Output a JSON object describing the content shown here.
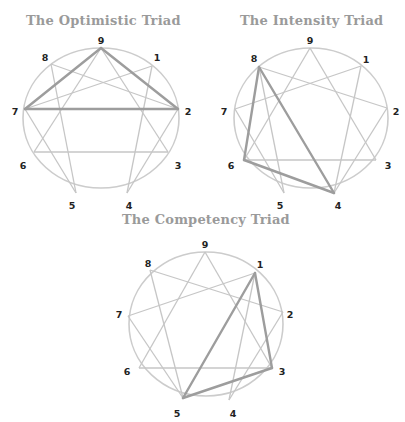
{
  "colors": {
    "title": "#9a9a9a",
    "circle": "#cccccc",
    "line": "#c6c6c6",
    "highlight": "#9d9d9d",
    "number": "#222222"
  },
  "diagrams": [
    {
      "title": "The Optimistic Triad",
      "title_pos": [
        26,
        13
      ],
      "center": [
        101,
        118
      ],
      "rx": 78,
      "ry": 70,
      "points": {
        "9": [
          101,
          48
        ],
        "1": [
          152,
          66
        ],
        "2": [
          178,
          109
        ],
        "3": [
          168,
          152
        ],
        "4": [
          127,
          193
        ],
        "5": [
          76,
          193
        ],
        "6": [
          34,
          152
        ],
        "7": [
          25,
          109
        ],
        "8": [
          51,
          64
        ]
      },
      "labels": {
        "9": [
          101,
          41
        ],
        "1": [
          157,
          58
        ],
        "2": [
          188,
          112
        ],
        "3": [
          178,
          166
        ],
        "4": [
          129,
          206
        ],
        "5": [
          72,
          206
        ],
        "6": [
          23,
          166
        ],
        "7": [
          15,
          112
        ],
        "8": [
          45,
          58
        ]
      },
      "highlight": [
        "9",
        "2",
        "7"
      ]
    },
    {
      "title": "The Intensity Triad",
      "title_pos": [
        240,
        13
      ],
      "center": [
        311,
        118
      ],
      "rx": 77,
      "ry": 70,
      "points": {
        "9": [
          310,
          48
        ],
        "1": [
          361,
          66
        ],
        "2": [
          387,
          108
        ],
        "3": [
          376,
          160
        ],
        "4": [
          334,
          193
        ],
        "5": [
          284,
          193
        ],
        "6": [
          244,
          160
        ],
        "7": [
          235,
          109
        ],
        "8": [
          259,
          67
        ]
      },
      "labels": {
        "9": [
          310,
          41
        ],
        "1": [
          366,
          60
        ],
        "2": [
          396,
          112
        ],
        "3": [
          388,
          166
        ],
        "4": [
          338,
          206
        ],
        "5": [
          280,
          206
        ],
        "6": [
          231,
          166
        ],
        "7": [
          224,
          112
        ],
        "8": [
          254,
          59
        ]
      },
      "highlight": [
        "8",
        "4",
        "6"
      ]
    },
    {
      "title": "The Competency Triad",
      "title_pos": [
        122,
        212
      ],
      "center": [
        206,
        324
      ],
      "rx": 77,
      "ry": 72,
      "points": {
        "9": [
          205,
          252
        ],
        "1": [
          255,
          273
        ],
        "2": [
          283,
          312
        ],
        "3": [
          272,
          368
        ],
        "4": [
          229,
          400
        ],
        "5": [
          183,
          398
        ],
        "6": [
          139,
          368
        ],
        "7": [
          128,
          316
        ],
        "8": [
          150,
          270
        ]
      },
      "labels": {
        "9": [
          205,
          245
        ],
        "1": [
          260,
          265
        ],
        "2": [
          290,
          315
        ],
        "3": [
          282,
          372
        ],
        "4": [
          233,
          414
        ],
        "5": [
          177,
          414
        ],
        "6": [
          127,
          372
        ],
        "7": [
          119,
          315
        ],
        "8": [
          148,
          264
        ]
      },
      "highlight": [
        "1",
        "3",
        "5"
      ]
    }
  ],
  "hexad_sequence": [
    "1",
    "4",
    "2",
    "8",
    "5",
    "7",
    "1"
  ],
  "triangle_sequence": [
    "3",
    "6",
    "9",
    "3"
  ]
}
